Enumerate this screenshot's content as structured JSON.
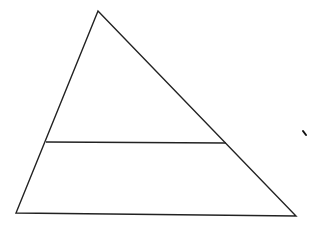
{
  "diagram": {
    "type": "geometry",
    "canvas": {
      "width": 316,
      "height": 227,
      "background": "#ffffff"
    },
    "stroke_color": "#222222",
    "stroke_width": 1.4,
    "triangle": {
      "apex": {
        "x": 98,
        "y": 11
      },
      "bottom_left": {
        "x": 16,
        "y": 213
      },
      "bottom_right": {
        "x": 296,
        "y": 216
      }
    },
    "cross_segment": {
      "left": {
        "x": 46,
        "y": 142
      },
      "right": {
        "x": 226,
        "y": 143
      }
    },
    "mark": {
      "x1": 303,
      "y1": 131,
      "x2": 306,
      "y2": 135
    }
  }
}
